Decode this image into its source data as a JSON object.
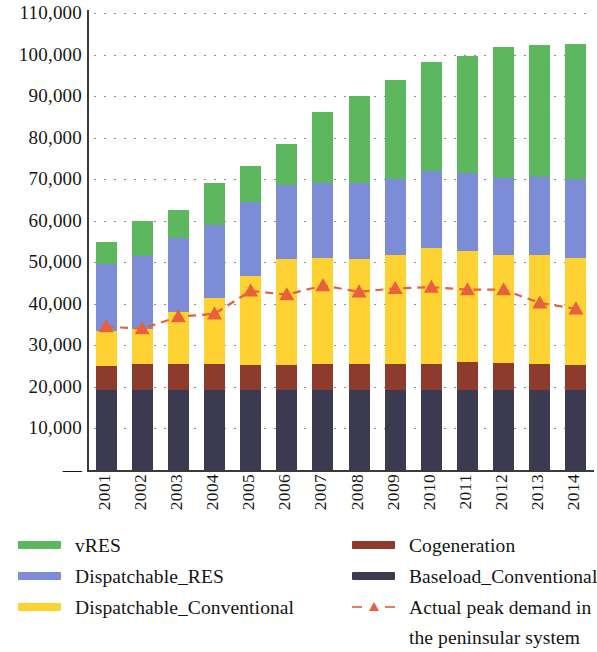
{
  "chart_data": {
    "type": "bar",
    "title": "",
    "subtitle": "",
    "xlabel": "",
    "ylabel": "",
    "stacked": true,
    "grid": true,
    "legend_position": "bottom",
    "ylim": [
      0,
      110000
    ],
    "ytick_step": 10000,
    "ytick_labels": [
      "110,000",
      "100,000",
      "90,000",
      "80,000",
      "70,000",
      "60,000",
      "50,000",
      "40,000",
      "30,000",
      "20,000",
      "10,000",
      "—"
    ],
    "ytick_values": [
      110000,
      100000,
      90000,
      80000,
      70000,
      60000,
      50000,
      40000,
      30000,
      20000,
      10000,
      0
    ],
    "categories": [
      "2001",
      "2002",
      "2003",
      "2004",
      "2005",
      "2006",
      "2007",
      "2008",
      "2009",
      "2010",
      "2011",
      "2012",
      "2013",
      "2014"
    ],
    "series": [
      {
        "name": "Baseload_Conventional",
        "color": "#3C3A51",
        "values": [
          19300,
          19300,
          19300,
          19300,
          19300,
          19300,
          19300,
          19300,
          19300,
          19300,
          19300,
          19300,
          19300,
          19300
        ]
      },
      {
        "name": "Cogeneration",
        "color": "#8C3B2D",
        "values": [
          5700,
          6200,
          6200,
          6200,
          5900,
          6000,
          6200,
          6200,
          6200,
          6200,
          6600,
          6400,
          6200,
          5900
        ]
      },
      {
        "name": "Dispatchable_Conventional",
        "color": "#FFD233",
        "values": [
          8400,
          8400,
          12500,
          15900,
          21600,
          25400,
          25600,
          25400,
          26300,
          28000,
          26900,
          26000,
          26300,
          25900
        ]
      },
      {
        "name": "Dispatchable_RES",
        "color": "#7D8CD6",
        "values": [
          16200,
          17600,
          17800,
          17600,
          17800,
          17900,
          18000,
          18100,
          18300,
          18400,
          18600,
          18700,
          18800,
          18900
        ]
      },
      {
        "name": "vRES",
        "color": "#5CB75F",
        "values": [
          5400,
          8500,
          6700,
          10100,
          8700,
          9800,
          17100,
          21000,
          23900,
          26200,
          28300,
          31500,
          31700,
          32500
        ]
      }
    ],
    "totals": [
      55000,
      60000,
      62500,
      69100,
      73300,
      78400,
      86200,
      90000,
      94000,
      98100,
      99700,
      101900,
      102300,
      102500
    ],
    "line_series": {
      "name": "Actual peak demand in the peninsular system",
      "color": "#E8603C",
      "marker": "triangle",
      "style": "dashed",
      "values": [
        34500,
        34000,
        36900,
        37600,
        43100,
        42200,
        44400,
        42900,
        43700,
        44000,
        43400,
        43400,
        40200,
        38800
      ]
    }
  },
  "legend": {
    "left_column": [
      {
        "label": "vRES",
        "color": "#5CB75F",
        "type": "swatch"
      },
      {
        "label": "Dispatchable_RES",
        "color": "#7D8CD6",
        "type": "swatch"
      },
      {
        "label": "Dispatchable_Conventional",
        "color": "#FFD233",
        "type": "swatch"
      }
    ],
    "right_column": [
      {
        "label": "Cogeneration",
        "color": "#8C3B2D",
        "type": "swatch"
      },
      {
        "label": "Baseload_Conventional",
        "color": "#3C3A51",
        "type": "swatch"
      },
      {
        "label": "Actual peak demand in the peninsular system",
        "color": "#E8603C",
        "type": "line-marker"
      }
    ]
  }
}
